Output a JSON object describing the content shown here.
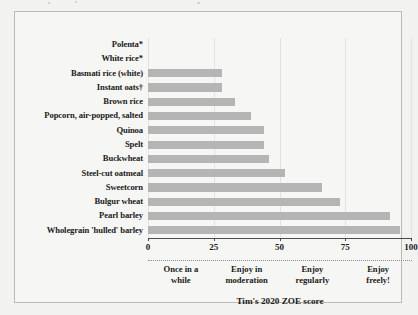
{
  "chart_data": {
    "type": "bar",
    "orientation": "horizontal",
    "title": "",
    "xlabel": "Tim's 2020 ZOE score",
    "ylabel": "",
    "xlim": [
      0,
      100
    ],
    "grid": true,
    "legend": null,
    "xticks": [
      "0",
      "25",
      "50",
      "75",
      "100"
    ],
    "xtick_values": [
      0,
      25,
      50,
      75,
      100
    ],
    "categories": [
      "Polenta*",
      "White rice*",
      "Basmati rice (white)",
      "Instant oats†",
      "Brown rice",
      "Popcorn, air-popped, salted",
      "Quinoa",
      "Spelt",
      "Buckwheat",
      "Steel-cut oatmeal",
      "Sweetcorn",
      "Bulgur wheat",
      "Pearl barley",
      "Wholegrain 'hulled' barley"
    ],
    "values": [
      0,
      0,
      28,
      28,
      33,
      39,
      44,
      44,
      46,
      52,
      66,
      73,
      92,
      96
    ],
    "bar_color": "#b5b5b5",
    "annotations": [
      {
        "text": "Once in a\nwhile",
        "line1": "Once in a",
        "line2": "while",
        "center_value": 12.5
      },
      {
        "text": "Enjoy in\nmoderation",
        "line1": "Enjoy in",
        "line2": "moderation",
        "center_value": 37.5
      },
      {
        "text": "Enjoy\nregularly",
        "line1": "Enjoy",
        "line2": "regularly",
        "center_value": 62.5
      },
      {
        "text": "Enjoy\nfreely!",
        "line1": "Enjoy",
        "line2": "freely!",
        "center_value": 87.5
      }
    ]
  },
  "caption": "Tim's 2020 ZOE score",
  "colors": {
    "page_background": "#f2f2f0",
    "figure_background": "#f6f6f4",
    "frame_border": "#b9b9b5",
    "bar_fill": "#b5b5b5",
    "gridline": "#e2e2df",
    "axis": "#4a4a4a",
    "text": "#1a1a1a"
  }
}
